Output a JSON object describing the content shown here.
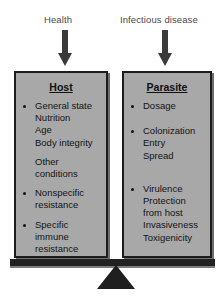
{
  "diagram": {
    "type": "balance-scale",
    "captions": {
      "left": "Health",
      "right": "Infectious disease"
    },
    "arrows": {
      "left_icon": "arrow-down-icon",
      "right_icon": "arrow-down-icon"
    },
    "panels": [
      {
        "id": "host",
        "title": "Host",
        "groups": [
          {
            "lines": [
              "General state",
              "Nutrition",
              "Age",
              "Body integrity"
            ]
          },
          {
            "lines": [
              "Other",
              "conditions"
            ],
            "bullet": false
          },
          {
            "lines": [
              "Nonspecific",
              "resistance"
            ]
          },
          {
            "lines": [
              "Specific",
              "immune",
              "resistance"
            ]
          }
        ]
      },
      {
        "id": "parasite",
        "title": "Parasite",
        "groups": [
          {
            "lines": [
              "Dosage"
            ]
          },
          {
            "lines": [
              "Colonization",
              "Entry",
              "Spread"
            ]
          },
          {
            "lines": [
              "Virulence",
              "Protection",
              "from host",
              "Invasiveness",
              "Toxigenicity"
            ]
          }
        ]
      }
    ],
    "fulcrum": {
      "beam_label": "balance-beam",
      "pivot_label": "fulcrum-triangle"
    },
    "colors": {
      "panel_fill": "#a8a8a8",
      "panel_border": "#1c1c1c",
      "arrow": "#3a3a3a",
      "beam": "#222222",
      "caption_text": "#4a4a4a",
      "body_text": "#141414"
    }
  }
}
